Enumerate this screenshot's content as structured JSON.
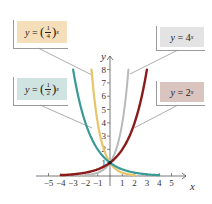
{
  "chart_data": {
    "type": "line",
    "title": "",
    "xlabel": "x",
    "ylabel": "y",
    "xlim": [
      -5,
      5
    ],
    "ylim": [
      0,
      8
    ],
    "x_ticks": [
      "-5",
      "-4",
      "-3",
      "-2",
      "-1",
      "1",
      "2",
      "3",
      "4",
      "5"
    ],
    "y_ticks": [
      "1",
      "2",
      "3",
      "4",
      "5",
      "6",
      "7",
      "8"
    ],
    "grid": false,
    "series": [
      {
        "name": "y = (1/4)^x",
        "base": 0.25,
        "color": "#e8c46a",
        "x": [
          -1.5,
          -1,
          -0.5,
          0,
          1,
          2
        ],
        "values": [
          8,
          4,
          2,
          1,
          0.25,
          0.0625
        ]
      },
      {
        "name": "y = (1/2)^x",
        "base": 0.5,
        "color": "#3a9a96",
        "x": [
          -3,
          -2,
          -1,
          0,
          1,
          2,
          3,
          4
        ],
        "values": [
          8,
          4,
          2,
          1,
          0.5,
          0.25,
          0.125,
          0.0625
        ]
      },
      {
        "name": "y = 4^x",
        "base": 4,
        "color": "#b9b9b9",
        "x": [
          -2,
          -1,
          0,
          0.5,
          1,
          1.5
        ],
        "values": [
          0.0625,
          0.25,
          1,
          2,
          4,
          8
        ]
      },
      {
        "name": "y = 2^x",
        "base": 2,
        "color": "#8b1a1a",
        "x": [
          -4,
          -3,
          -2,
          -1,
          0,
          1,
          2,
          3
        ],
        "values": [
          0.0625,
          0.125,
          0.25,
          0.5,
          1,
          2,
          4,
          8
        ]
      }
    ],
    "annotations": [
      {
        "text": "y = (1/4)^x",
        "box_color": "#f5dfba"
      },
      {
        "text": "y = (1/2)^x",
        "box_color": "#cfe3e1"
      },
      {
        "text": "y = 4^x",
        "box_color": "#e3e3e3"
      },
      {
        "text": "y = 2^x",
        "box_color": "#d9c4c0"
      }
    ],
    "intersection_point": [
      0,
      1
    ]
  },
  "labels": {
    "quarter": {
      "y": "y",
      "eq": "=",
      "num": "1",
      "den": "4",
      "exp": "x"
    },
    "half": {
      "y": "y",
      "eq": "=",
      "num": "1",
      "den": "2",
      "exp": "x"
    },
    "four": {
      "y": "y",
      "eq": "= 4",
      "exp": "x"
    },
    "two": {
      "y": "y",
      "eq": "= 2",
      "exp": "x"
    }
  },
  "axes": {
    "x_label": "x",
    "y_label": "y"
  }
}
